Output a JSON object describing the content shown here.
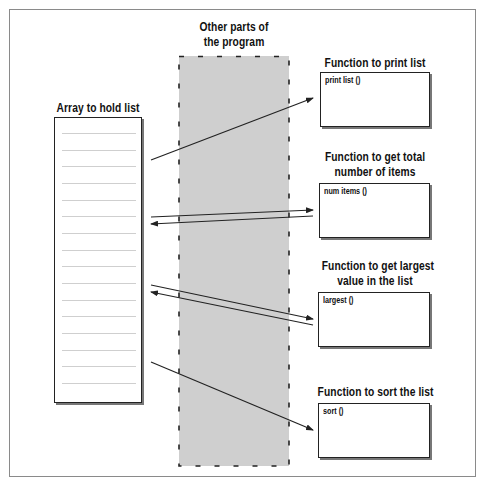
{
  "diagram": {
    "region": {
      "title_line1": "Other parts of",
      "title_line2": "the program",
      "fill": "#cfcfcf"
    },
    "array": {
      "title": "Array to hold list",
      "slot_count": 16
    },
    "functions": [
      {
        "title_line1": "Function to print list",
        "title_line2": "",
        "label": "print list ()"
      },
      {
        "title_line1": "Function to get total",
        "title_line2": "number of items",
        "label": "num items ()"
      },
      {
        "title_line1": "Function to get largest",
        "title_line2": "value in the list",
        "label": "largest ()"
      },
      {
        "title_line1": "Function to sort the list",
        "title_line2": "",
        "label": "sort ()"
      }
    ],
    "arrows": [
      {
        "from": "array",
        "to": "print list ()",
        "direction": "one-way"
      },
      {
        "from": "array",
        "to": "num items ()",
        "direction": "two-way"
      },
      {
        "from": "array",
        "to": "largest ()",
        "direction": "two-way"
      },
      {
        "from": "array",
        "to": "sort ()",
        "direction": "one-way"
      }
    ],
    "colors": {
      "line": "#222222",
      "frame": "#8a8a8a",
      "slot_line": "#cfcfcf"
    }
  }
}
